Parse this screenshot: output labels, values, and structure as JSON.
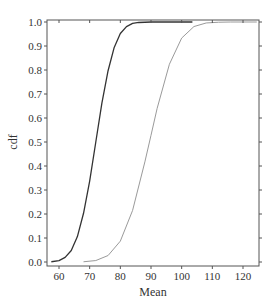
{
  "chart_data": {
    "type": "line",
    "title": "",
    "xlabel": "Mean",
    "ylabel": "cdf",
    "xlim": [
      56.1,
      125.2
    ],
    "ylim": [
      -0.015,
      1.01
    ],
    "xticks": [
      60,
      70,
      80,
      90,
      100,
      110,
      120
    ],
    "yticks": [
      0.0,
      0.1,
      0.2,
      0.3,
      0.4,
      0.5,
      0.6,
      0.7,
      0.8,
      0.9,
      1.0
    ],
    "ytick_labels": [
      "0.0",
      "0.1",
      "0.2",
      "0.3",
      "0.4",
      "0.5",
      "0.6",
      "0.7",
      "0.8",
      "0.9",
      "1.0"
    ],
    "grid": false,
    "legend": null,
    "series": [
      {
        "name": "dark curve",
        "color": "#333333",
        "x": [
          57.5,
          60,
          62,
          64,
          66,
          68,
          70,
          72,
          74,
          76,
          78,
          80,
          82,
          84,
          86,
          90,
          95,
          103.5
        ],
        "y": [
          0.001,
          0.006,
          0.019,
          0.048,
          0.106,
          0.203,
          0.337,
          0.5,
          0.663,
          0.797,
          0.894,
          0.952,
          0.981,
          0.994,
          0.998,
          1.0,
          1.0,
          1.0
        ]
      },
      {
        "name": "light curve",
        "color": "#9a9a9a",
        "x": [
          68,
          72,
          76,
          80,
          84,
          88,
          90,
          92,
          96,
          100,
          104,
          108,
          112,
          116,
          120,
          124.5
        ],
        "y": [
          0.001,
          0.006,
          0.027,
          0.087,
          0.215,
          0.417,
          0.528,
          0.64,
          0.824,
          0.933,
          0.981,
          0.996,
          0.999,
          1.0,
          1.0,
          1.0
        ]
      }
    ]
  }
}
